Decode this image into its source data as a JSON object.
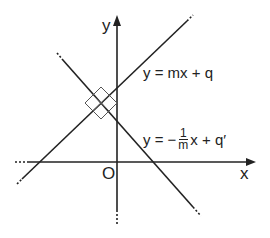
{
  "diagram": {
    "axes": {
      "x_label": "x",
      "y_label": "y",
      "origin_label": "O"
    },
    "lines": [
      {
        "name": "line-1",
        "equation": "y = mx + q"
      },
      {
        "name": "line-2",
        "equation_prefix": "y = −",
        "frac_num": "1",
        "frac_den": "m",
        "equation_suffix": "x + q′"
      }
    ],
    "right_angle_marker": "perpendicular-intersection",
    "colors": {
      "stroke": "#222222",
      "background": "#ffffff"
    }
  }
}
